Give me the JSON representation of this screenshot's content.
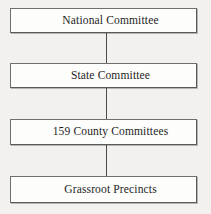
{
  "diagram": {
    "type": "vertical-flowchart",
    "background_color": "#f2f1ef",
    "box_fill_color": "#fdfdfc",
    "box_border_color": "#6f6f6f",
    "connector_color": "#4a4a4a",
    "text_color": "#1d1d1d",
    "nodes": [
      {
        "id": "national-committee",
        "label": "National Committee"
      },
      {
        "id": "state-committee",
        "label": "State Committee"
      },
      {
        "id": "county-committees",
        "label": "159 County Committees"
      },
      {
        "id": "grassroot-precincts",
        "label": "Grassroot Precincts"
      }
    ],
    "connectors": [
      {
        "from": "national-committee",
        "to": "state-committee"
      },
      {
        "from": "state-committee",
        "to": "county-committees"
      },
      {
        "from": "county-committees",
        "to": "grassroot-precincts"
      }
    ]
  }
}
